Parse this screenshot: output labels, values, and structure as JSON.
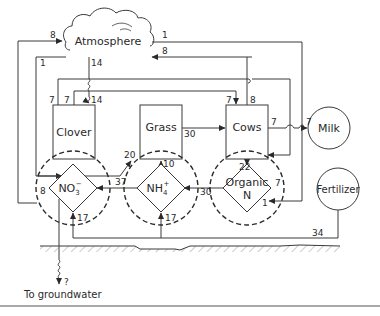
{
  "diagram": {
    "nodes": {
      "atmosphere": "Atmosphere",
      "clover": "Clover",
      "grass": "Grass",
      "cows": "Cows",
      "milk": "Milk",
      "fertilizer": "Fertilizer",
      "nitrate": {
        "base": "NO",
        "sub": "3",
        "sup": "−"
      },
      "ammonium": {
        "base": "NH",
        "sub": "4",
        "sup": "+"
      },
      "organic_n": {
        "line1": "Organic",
        "line2": "N"
      },
      "groundwater": "To groundwater"
    },
    "flows": {
      "no3_to_atmosphere": "8",
      "atmosphere_to_organic_return": "1",
      "cows_to_atmosphere": "8",
      "atmosphere_to_no3": "1",
      "atmosphere_to_clover_fixation": "14",
      "clover_fixation_in": "14",
      "clover_to_cows_a": "7",
      "clover_to_cows_b": "7",
      "clover_to_cows_in": "7",
      "cows_out_up": "8",
      "grass_to_cows": "30",
      "cows_to_milk_a": "7",
      "cows_to_milk_b": "7",
      "no3_to_grass": "20",
      "nh4_to_grass": "10",
      "cows_to_organic": "22",
      "nh4_to_no3": "37",
      "organic_to_nh4": "30",
      "organic_in_a": "7",
      "organic_in_b": "1",
      "no3_in_left": "8",
      "fertilizer_to_no3": "17",
      "fertilizer_to_nh4": "17",
      "fertilizer_total": "34",
      "leaching": "?"
    }
  }
}
